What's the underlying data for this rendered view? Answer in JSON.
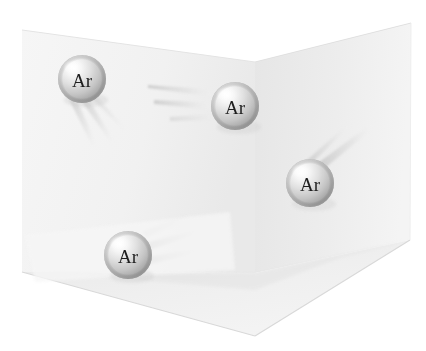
{
  "figure": {
    "background_color": "#ffffff"
  },
  "container": {
    "name": "open-box",
    "faces": [
      {
        "id": "left-wall",
        "label": "Left wall",
        "fill": "#f2f2f2",
        "points": "22,30 255,62 255,273 22,272"
      },
      {
        "id": "right-wall",
        "label": "Right wall",
        "fill": "#ebebeb",
        "points": "255,62 411,23 410,240 255,273"
      },
      {
        "id": "floor",
        "label": "Floor",
        "fill": "#eeeeee",
        "points": "22,272 255,273 410,240 255,336"
      }
    ],
    "edges": [
      {
        "id": "vertical-corner",
        "from": "255,62",
        "to": "255,273",
        "color": "#dcdcdc"
      },
      {
        "id": "floor-left-edge",
        "from": "22,272",
        "to": "255,336",
        "color": "#d8d8d8"
      },
      {
        "id": "floor-right-edge",
        "from": "255,336",
        "to": "410,240",
        "color": "#d8d8d8"
      }
    ]
  },
  "atoms": [
    {
      "id": "atom-1",
      "label": "Ar",
      "element": "Argon",
      "cx": 82,
      "cy": 79,
      "r": 24,
      "trails": [
        {
          "tip_x": 115,
          "tip_y": 140,
          "width": 7
        },
        {
          "tip_x": 96,
          "tip_y": 142,
          "width": 6
        }
      ]
    },
    {
      "id": "atom-2",
      "label": "Ar",
      "element": "Argon",
      "cx": 235,
      "cy": 106,
      "r": 24,
      "trails": [
        {
          "tip_x": 152,
          "tip_y": 88,
          "width": 7
        },
        {
          "tip_x": 157,
          "tip_y": 103,
          "width": 6
        }
      ]
    },
    {
      "id": "atom-3",
      "label": "Ar",
      "element": "Argon",
      "cx": 310,
      "cy": 183,
      "r": 24,
      "trails": [
        {
          "tip_x": 368,
          "tip_y": 130,
          "width": 7
        },
        {
          "tip_x": 355,
          "tip_y": 127,
          "width": 6
        }
      ]
    },
    {
      "id": "atom-4",
      "label": "Ar",
      "element": "Argon",
      "cx": 128,
      "cy": 255,
      "r": 24,
      "trails": [
        {
          "tip_x": 205,
          "tip_y": 235,
          "width": 8
        },
        {
          "tip_x": 200,
          "tip_y": 252,
          "width": 7
        }
      ]
    }
  ],
  "sphere_style": {
    "highlight_color": "#ffffff",
    "mid_color": "#d6d6d6",
    "edge_color": "#9e9e9e",
    "shadow_color": "#8a8a8a",
    "label_color": "#1a1a1a"
  },
  "trail_style": {
    "color": "#cfcfcf",
    "fade_color": "#ffffff"
  }
}
